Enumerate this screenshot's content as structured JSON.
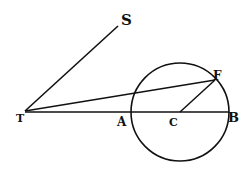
{
  "diagram": {
    "type": "geometric-figure",
    "stroke_color": "#111111",
    "background": "#ffffff",
    "points": {
      "T": {
        "x": 25,
        "y": 111,
        "label": "T"
      },
      "S": {
        "x": 118,
        "y": 26,
        "label": "S"
      },
      "A": {
        "x": 131,
        "y": 112,
        "label": "A"
      },
      "C": {
        "x": 180,
        "y": 112,
        "label": "C"
      },
      "B": {
        "x": 229,
        "y": 112,
        "label": "B"
      },
      "F": {
        "x": 215,
        "y": 80,
        "label": "F"
      }
    },
    "circle": {
      "center": "C",
      "cx": 180,
      "cy": 112,
      "r": 49
    },
    "segments": [
      {
        "from": "T",
        "to": "S"
      },
      {
        "from": "T",
        "to": "F"
      },
      {
        "from": "T",
        "to": "B"
      },
      {
        "from": "C",
        "to": "F"
      }
    ],
    "labels": {
      "T": "T",
      "S": "S",
      "A": "A",
      "C": "C",
      "B": "B",
      "F": "F"
    }
  }
}
